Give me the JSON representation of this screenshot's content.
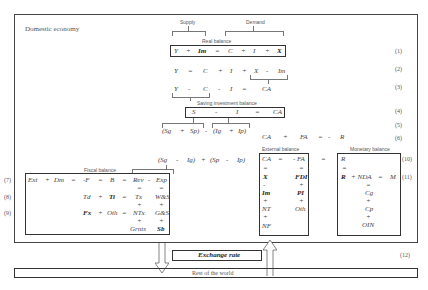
{
  "domestic": {
    "title": "Domestic economy"
  },
  "labels": {
    "supply": "Supply",
    "demand": "Demand",
    "real_balance": "Real balance",
    "saving_investment": "Saving investment balance",
    "fiscal": "Fiscal balance",
    "external": "External balance",
    "monetary": "Monetary balance"
  },
  "equations": {
    "e1": [
      "Y",
      "+",
      "Im",
      "=",
      "C",
      "+",
      "I",
      "+",
      "X"
    ],
    "e2": [
      "Y",
      "=",
      "C",
      "+",
      "I",
      "+",
      "X",
      "-",
      "Im"
    ],
    "e3": [
      "Y",
      "-",
      "C",
      "-",
      "I",
      "=",
      "CA"
    ],
    "e4": [
      "S",
      "-",
      "I",
      "=",
      "CA"
    ],
    "e5": [
      "(Sg",
      "+",
      "Sp)",
      "-",
      "(Ig",
      "+",
      "Ip)"
    ],
    "e6": [
      "CA",
      "+",
      "FA",
      "=",
      "-",
      "R"
    ],
    "e10": [
      "(Sg",
      "-",
      "Ig)",
      "+",
      "(Sp",
      "-",
      "Ip)"
    ],
    "fiscal_row7": [
      "Ext",
      "+",
      "Dm",
      "=",
      "-F",
      "=",
      "B",
      "=",
      "Rev",
      "-",
      "Exp"
    ],
    "fiscal_row8": [
      "Td",
      "+",
      "Ti",
      "=",
      "Tx",
      "W&S"
    ],
    "fiscal_row9": [
      "Fx",
      "+",
      "Oth",
      "=",
      "NTx",
      "G&S"
    ],
    "fiscal_row10": [
      "Grnts",
      "Sb"
    ],
    "external_col_left": [
      "CA",
      "=",
      "X",
      "-",
      "Im",
      "+",
      "NT",
      "+",
      "NF"
    ],
    "external_col_right": [
      "- FA",
      "=",
      "FDI",
      "+",
      "PI",
      "+",
      "Oth"
    ],
    "monetary": [
      "R",
      "=",
      "R",
      "+ NDA",
      "=",
      "M",
      "Cg",
      "+",
      "Cp",
      "+",
      "OIN"
    ]
  },
  "numbers": [
    "(1)",
    "(2)",
    "(3)",
    "(4)",
    "(5)",
    "(6)",
    "(7)",
    "(8)",
    "(9)",
    "(10)",
    "(11)",
    "(12)"
  ],
  "exchange_rate": "Exchange rate",
  "rest_of_world": "Rest of the world"
}
